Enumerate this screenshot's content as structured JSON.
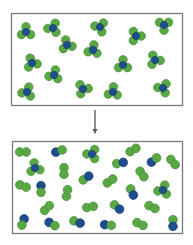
{
  "diagram": {
    "colors": {
      "green": "#5aa843",
      "green_stroke": "#3f8a35",
      "blue": "#1f4e8f",
      "blue_stroke": "#17396c",
      "box_border": "#7a7a7a",
      "arrow": "#555555"
    },
    "top_box": {
      "x": 11.5,
      "y": 13.5,
      "w": 171,
      "h": 92
    },
    "bottom_box": {
      "x": 12.5,
      "y": 141.5,
      "w": 170,
      "h": 92
    },
    "arrow": {
      "x": 95,
      "y1": 110,
      "y2": 134
    },
    "top_molecules": [
      {
        "type": "tri",
        "x": 26,
        "y": 32,
        "rot": 0
      },
      {
        "type": "tri",
        "x": 53,
        "y": 28,
        "rot": 25
      },
      {
        "type": "tri",
        "x": 67,
        "y": 45,
        "rot": -15
      },
      {
        "type": "tri",
        "x": 100,
        "y": 27,
        "rot": 40
      },
      {
        "type": "tri",
        "x": 93,
        "y": 50,
        "rot": 10
      },
      {
        "type": "tri",
        "x": 136,
        "y": 36,
        "rot": -30
      },
      {
        "type": "tri",
        "x": 164,
        "y": 25,
        "rot": 60
      },
      {
        "type": "tri",
        "x": 32,
        "y": 63,
        "rot": -20
      },
      {
        "type": "tri",
        "x": 54,
        "y": 75,
        "rot": 15
      },
      {
        "type": "tri",
        "x": 123,
        "y": 65,
        "rot": 0
      },
      {
        "type": "tri",
        "x": 155,
        "y": 60,
        "rot": -25
      },
      {
        "type": "tri",
        "x": 27,
        "y": 92,
        "rot": 20
      },
      {
        "type": "tri",
        "x": 83,
        "y": 89,
        "rot": -35
      },
      {
        "type": "tri",
        "x": 113,
        "y": 92,
        "rot": 5
      },
      {
        "type": "tri",
        "x": 163,
        "y": 88,
        "rot": 35
      }
    ],
    "bottom_molecules": [
      {
        "type": "gg",
        "x": 23,
        "y": 152,
        "rot": 0
      },
      {
        "type": "bg",
        "x": 59,
        "y": 151,
        "rot": -20
      },
      {
        "type": "tri",
        "x": 92,
        "y": 154,
        "rot": 30
      },
      {
        "type": "gg",
        "x": 133,
        "y": 150,
        "rot": -30
      },
      {
        "type": "tri",
        "x": 35,
        "y": 168,
        "rot": -10
      },
      {
        "type": "gb",
        "x": 120,
        "y": 163,
        "rot": -10
      },
      {
        "type": "bg",
        "x": 154,
        "y": 160,
        "rot": -40
      },
      {
        "type": "gg",
        "x": 173,
        "y": 162,
        "rot": 50
      },
      {
        "type": "gg",
        "x": 64,
        "y": 171,
        "rot": 90
      },
      {
        "type": "gb",
        "x": 86,
        "y": 178,
        "rot": -35
      },
      {
        "type": "gg",
        "x": 110,
        "y": 181,
        "rot": -35
      },
      {
        "type": "gg",
        "x": 142,
        "y": 174,
        "rot": 55
      },
      {
        "type": "gg",
        "x": 23,
        "y": 186,
        "rot": 20
      },
      {
        "type": "bg",
        "x": 41,
        "y": 189,
        "rot": 90
      },
      {
        "type": "gg",
        "x": 67,
        "y": 193,
        "rot": -80
      },
      {
        "type": "gb",
        "x": 132,
        "y": 192,
        "rot": 65
      },
      {
        "type": "tri",
        "x": 163,
        "y": 190,
        "rot": 20
      },
      {
        "type": "gg",
        "x": 47,
        "y": 208,
        "rot": -45
      },
      {
        "type": "gg",
        "x": 90,
        "y": 207,
        "rot": -10
      },
      {
        "type": "gb",
        "x": 117,
        "y": 207,
        "rot": 40
      },
      {
        "type": "gg",
        "x": 152,
        "y": 207,
        "rot": 25
      },
      {
        "type": "bg",
        "x": 23,
        "y": 222,
        "rot": 110
      },
      {
        "type": "bg",
        "x": 52,
        "y": 224,
        "rot": 30
      },
      {
        "type": "gb",
        "x": 77,
        "y": 222,
        "rot": 20
      },
      {
        "type": "bg",
        "x": 108,
        "y": 225,
        "rot": 5
      },
      {
        "type": "gg",
        "x": 140,
        "y": 224,
        "rot": 25
      },
      {
        "type": "gb",
        "x": 173,
        "y": 223,
        "rot": 90
      }
    ]
  }
}
